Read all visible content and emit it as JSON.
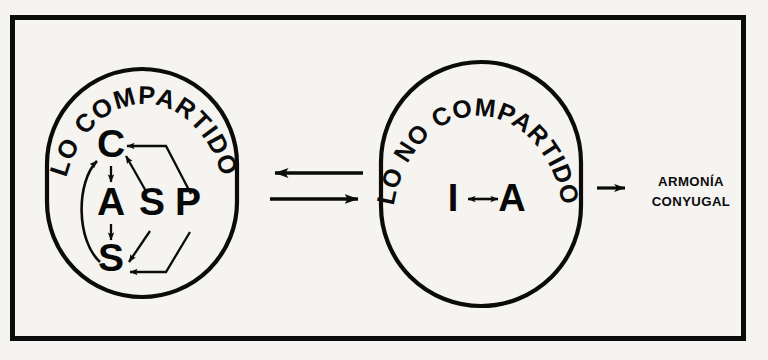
{
  "figure": {
    "background_color": "#f5f4f1",
    "ink_color": "#0b0b0b",
    "frame": {
      "name": "outer-border"
    }
  },
  "shared_group": {
    "arc_label": "LO COMPARTIDO",
    "arc_label_chars": [
      "L",
      "O",
      " ",
      "C",
      "O",
      "M",
      "P",
      "A",
      "R",
      "T",
      "I",
      "D",
      "O"
    ],
    "nodes": [
      {
        "id": "C",
        "label": "C"
      },
      {
        "id": "A",
        "label": "A"
      },
      {
        "id": "S",
        "label": "S"
      },
      {
        "id": "P",
        "label": "P"
      }
    ],
    "edges": [
      {
        "from": "C",
        "to": "A",
        "style": "straight",
        "heads": "single"
      },
      {
        "from": "A",
        "to": "S",
        "style": "straight",
        "heads": "single"
      },
      {
        "from": "S",
        "to": "C",
        "style": "curved",
        "heads": "single"
      },
      {
        "from": "S",
        "to": "C",
        "style": "diagonal",
        "heads": "single"
      },
      {
        "from": "S",
        "to": "S",
        "style": "diagonal",
        "heads": "single"
      },
      {
        "from": "P",
        "to": "C",
        "style": "polyline",
        "heads": "single"
      },
      {
        "from": "P",
        "to": "S",
        "style": "polyline",
        "heads": "single"
      }
    ]
  },
  "not_shared_group": {
    "arc_label": "LO NO COMPARTIDO",
    "arc_label_chars": [
      "L",
      "O",
      " ",
      "N",
      "O",
      " ",
      "C",
      "O",
      "M",
      "P",
      "A",
      "R",
      "T",
      "I",
      "D",
      "O"
    ],
    "nodes": [
      {
        "id": "I",
        "label": "I"
      },
      {
        "id": "A",
        "label": "A"
      }
    ],
    "edges": [
      {
        "from": "I",
        "to": "A",
        "style": "straight",
        "heads": "double"
      }
    ]
  },
  "connectors": {
    "between_groups": [
      {
        "name": "arrow-right-to-left",
        "direction": "left"
      },
      {
        "name": "arrow-left-to-right",
        "direction": "right"
      }
    ],
    "to_outcome": {
      "name": "arrow-to-outcome",
      "direction": "right"
    }
  },
  "outcome": {
    "line1": "ARMONÍA",
    "line2": "CONYUGAL"
  }
}
